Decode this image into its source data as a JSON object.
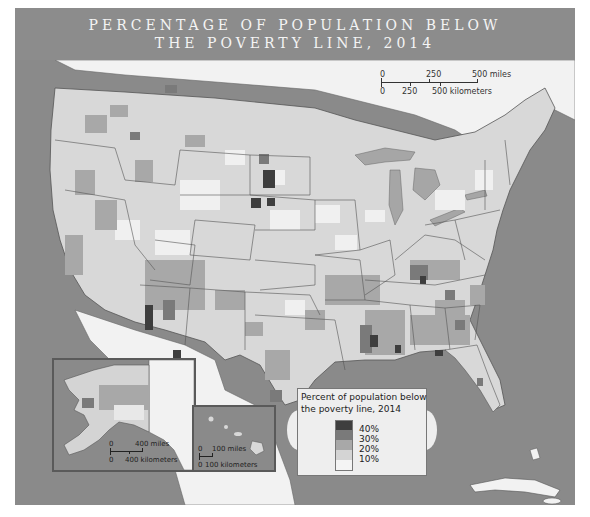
{
  "title": {
    "line1": "PERCENTAGE OF POPULATION BELOW",
    "line2": "THE POVERTY LINE, 2014"
  },
  "colors": {
    "header_bg": "#8c8c8c",
    "ocean": "#8a8a8a",
    "land_foreign": "#f2f2f2",
    "class_0_10": "#f0f0f0",
    "class_10_20": "#d4d4d4",
    "class_20_30": "#a8a8a8",
    "class_30_40": "#7a7a7a",
    "class_40_plus": "#3e3e3e",
    "border": "#555555"
  },
  "scale_bar": {
    "miles_ticks": [
      "0",
      "250",
      "500 miles"
    ],
    "km_ticks": [
      "0",
      "250",
      "500 kilometers"
    ]
  },
  "legend": {
    "title_line1": "Percent of population below",
    "title_line2": "the poverty line, 2014",
    "labels": [
      "40%",
      "30%",
      "20%",
      "10%"
    ]
  },
  "insets": {
    "alaska": {
      "name": "Alaska",
      "scale_miles": [
        "0",
        "400 miles"
      ],
      "scale_km": [
        "0",
        "400 kilometers"
      ]
    },
    "hawaii": {
      "name": "Hawaii",
      "scale_miles": [
        "0",
        "100 miles"
      ],
      "scale_km": [
        "0",
        "100 kilometers"
      ]
    }
  }
}
